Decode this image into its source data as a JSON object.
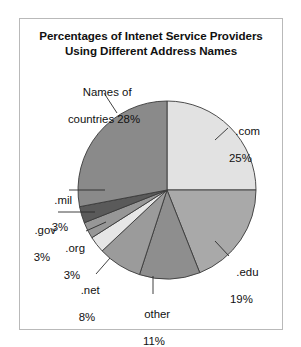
{
  "chart_data": {
    "type": "pie",
    "title": "Percentages of Intenet Service Providers Using Different Address Names",
    "title_line1": "Percentages of Intenet Service Providers",
    "title_line2": "Using Different Address Names",
    "xlabel": "",
    "ylabel": "",
    "legend_position": "none",
    "grid": false,
    "units": "percent",
    "total": 100,
    "categories": [
      ".com",
      ".edu",
      "other",
      ".net",
      ".org",
      ".gov",
      ".mil",
      "Names of countries"
    ],
    "values": [
      25,
      19,
      11,
      8,
      3,
      3,
      3,
      28
    ],
    "start_angle_deg": 0,
    "direction": "clockwise",
    "slices": [
      {
        "name": ".com",
        "label": ".com",
        "percent_text": "25%",
        "value": 25,
        "color": "#e2e2e2",
        "start_deg": 0,
        "end_deg": 90
      },
      {
        "name": ".edu",
        "label": ".edu",
        "percent_text": "19%",
        "value": 19,
        "color": "#a9a9a9",
        "start_deg": 90,
        "end_deg": 158.4
      },
      {
        "name": "other",
        "label": "other",
        "percent_text": "11%",
        "value": 11,
        "color": "#8e8e8e",
        "start_deg": 158.4,
        "end_deg": 198
      },
      {
        "name": ".net",
        "label": ".net",
        "percent_text": "8%",
        "value": 8,
        "color": "#9b9b9b",
        "start_deg": 198,
        "end_deg": 226.8
      },
      {
        "name": ".org",
        "label": ".org",
        "percent_text": "3%",
        "value": 3,
        "color": "#e6e6e6",
        "start_deg": 226.8,
        "end_deg": 237.6
      },
      {
        "name": ".gov",
        "label": ".gov",
        "percent_text": "3%",
        "value": 3,
        "color": "#979797",
        "start_deg": 237.6,
        "end_deg": 248.4
      },
      {
        "name": ".mil",
        "label": ".mil",
        "percent_text": "3%",
        "value": 3,
        "color": "#5a5a5a",
        "start_deg": 248.4,
        "end_deg": 259.2
      },
      {
        "name": "names-of-countries",
        "label_line1": "Names of",
        "label_line2": "countries 28%",
        "label": "Names of countries",
        "percent_text": "28%",
        "value": 28,
        "color": "#8a8a8a",
        "start_deg": 259.2,
        "end_deg": 360
      }
    ]
  },
  "labels": {
    "countries_line1": "Names of",
    "countries_line2": "countries 28%",
    "com_name": ".com",
    "com_pct": "25%",
    "edu_name": ".edu",
    "edu_pct": "19%",
    "other_name": "other",
    "other_pct": "11%",
    "net_name": ".net",
    "net_pct": "8%",
    "org_name": ".org",
    "org_pct": "3%",
    "gov_name": ".gov",
    "gov_pct": "3%",
    "mil_name": ".mil",
    "mil_pct": "3%"
  },
  "style": {
    "pie_outline_color": "#3a3a3a",
    "frame_color": "#b9b9b9",
    "background": "#ffffff",
    "text_color": "#111111",
    "leader_color": "#2b2b2b"
  },
  "geometry": {
    "cx": 167,
    "cy": 190,
    "r": 89
  }
}
